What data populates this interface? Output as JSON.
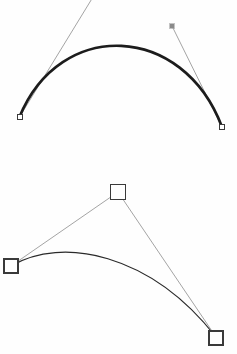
{
  "canvas": {
    "width": 237,
    "height": 354,
    "background_color": "#fefefe",
    "title": "Bezier curve construction diagram"
  },
  "colors": {
    "curve_dark": "#1c1c1c",
    "curve_thin": "#2a2a2a",
    "handle_line": "#8d8d8d",
    "anchor_outline": "#3a3a3a",
    "anchor_fill": "#ffffff",
    "control_filled": "#8a8a8a",
    "background": "#fefefe"
  },
  "figures": [
    {
      "name": "top-cubic-bezier",
      "description": "Heavy arc with thin tangent handle lines and small square anchors",
      "curve": {
        "type": "cubic-bezier",
        "stroke_width": 2.7,
        "start": [
          19.5,
          117.0
        ],
        "control1": [
          60.0,
          18.0
        ],
        "control2": [
          183.0,
          23.0
        ],
        "end": [
          222.0,
          127.0
        ],
        "apex": [
          120.0,
          32.0
        ]
      },
      "handles": [
        {
          "name": "left-tangent-handle",
          "from": [
            19.5,
            117.0
          ],
          "to": [
            93.0,
            -3.0
          ],
          "stroke_width": 0.8
        },
        {
          "name": "right-tangent-handle",
          "from": [
            172.0,
            26.0
          ],
          "to": [
            222.0,
            127.0
          ],
          "stroke_width": 0.8
        }
      ],
      "points": [
        {
          "name": "start-anchor",
          "kind": "hollow-square",
          "x": 19.5,
          "y": 117.0,
          "size": 5.0
        },
        {
          "name": "end-anchor",
          "kind": "hollow-square",
          "x": 222.0,
          "y": 127.0,
          "size": 5.0
        },
        {
          "name": "right-control-handle",
          "kind": "filled-square",
          "x": 172.0,
          "y": 26.0,
          "size": 4.5
        }
      ]
    },
    {
      "name": "bottom-quadratic-bezier",
      "description": "Thin arc with two straight control polygon legs and three large hollow square handles",
      "curve": {
        "type": "cubic-bezier",
        "stroke_width": 1.2,
        "start": [
          11.0,
          266.0
        ],
        "control1": [
          62.0,
          236.0
        ],
        "control2": [
          150.0,
          253.0
        ],
        "end": [
          216.0,
          337.0
        ],
        "apex": [
          88.0,
          244.0
        ]
      },
      "handles": [
        {
          "name": "left-control-leg",
          "from": [
            11.0,
            266.0
          ],
          "to": [
            118.0,
            192.0
          ],
          "stroke_width": 0.8
        },
        {
          "name": "right-control-leg",
          "from": [
            118.0,
            192.0
          ],
          "to": [
            216.0,
            337.0
          ],
          "stroke_width": 0.8
        }
      ],
      "points": [
        {
          "name": "start-anchor",
          "kind": "hollow-square",
          "x": 11.0,
          "y": 266.0,
          "size": 14.0
        },
        {
          "name": "apex-control-point",
          "kind": "hollow-square",
          "x": 118.0,
          "y": 192.0,
          "size": 15.0
        },
        {
          "name": "end-anchor",
          "kind": "hollow-square",
          "x": 216.0,
          "y": 338.0,
          "size": 14.0
        }
      ]
    }
  ],
  "chart_data": {
    "type": "line",
    "xlabel": "",
    "ylabel": "",
    "xlim": [
      0,
      237
    ],
    "ylim": [
      354,
      0
    ],
    "grid": false,
    "legend": "none",
    "series": [
      {
        "name": "top-curve",
        "kind": "cubic-bezier",
        "points": [
          [
            19.5,
            117.0
          ],
          [
            60.0,
            18.0
          ],
          [
            183.0,
            23.0
          ],
          [
            222.0,
            127.0
          ]
        ]
      },
      {
        "name": "top-left-handle",
        "kind": "segment",
        "points": [
          [
            19.5,
            117.0
          ],
          [
            93.0,
            -3.0
          ]
        ]
      },
      {
        "name": "top-right-handle",
        "kind": "segment",
        "points": [
          [
            172.0,
            26.0
          ],
          [
            222.0,
            127.0
          ]
        ]
      },
      {
        "name": "bottom-curve",
        "kind": "cubic-bezier",
        "points": [
          [
            11.0,
            266.0
          ],
          [
            62.0,
            236.0
          ],
          [
            150.0,
            253.0
          ],
          [
            216.0,
            337.0
          ]
        ]
      },
      {
        "name": "bottom-left-leg",
        "kind": "segment",
        "points": [
          [
            11.0,
            266.0
          ],
          [
            118.0,
            192.0
          ]
        ]
      },
      {
        "name": "bottom-right-leg",
        "kind": "segment",
        "points": [
          [
            118.0,
            192.0
          ],
          [
            216.0,
            337.0
          ]
        ]
      }
    ],
    "markers": [
      {
        "name": "top-start-anchor",
        "x": 19.5,
        "y": 117.0,
        "style": "hollow-square",
        "size": 5.0
      },
      {
        "name": "top-end-anchor",
        "x": 222.0,
        "y": 127.0,
        "style": "hollow-square",
        "size": 5.0
      },
      {
        "name": "top-right-control",
        "x": 172.0,
        "y": 26.0,
        "style": "filled-square",
        "size": 4.5
      },
      {
        "name": "bottom-start-anchor",
        "x": 11.0,
        "y": 266.0,
        "style": "hollow-square",
        "size": 14.0
      },
      {
        "name": "bottom-apex-control",
        "x": 118.0,
        "y": 192.0,
        "style": "hollow-square",
        "size": 15.0
      },
      {
        "name": "bottom-end-anchor",
        "x": 216.0,
        "y": 338.0,
        "style": "hollow-square",
        "size": 14.0
      }
    ]
  }
}
